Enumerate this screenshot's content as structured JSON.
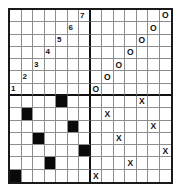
{
  "puzzle": {
    "title": "Grid Puzzle",
    "columns": 14,
    "rows": 14,
    "quadrant_size": 7,
    "colors": {
      "background": "#ffffff",
      "outer_border": "#1a1a1a",
      "thin_gridline": "#8d8d8d",
      "thick_gridline": "#111111",
      "filled_cell": "#0a0a0a",
      "glyph": "#111111"
    },
    "legend": {
      "number_note": "digits 1-7 on anti-diagonal of top-left quadrant",
      "o_note": "letter O on anti-diagonal of top-right quadrant",
      "x_note": "letter X scattered in bottom-right quadrant",
      "black_note": "filled black squares scattered in bottom-left quadrant"
    },
    "cells": [
      [
        {
          "type": "empty",
          "value": ""
        },
        {
          "type": "empty",
          "value": ""
        },
        {
          "type": "empty",
          "value": ""
        },
        {
          "type": "empty",
          "value": ""
        },
        {
          "type": "empty",
          "value": ""
        },
        {
          "type": "empty",
          "value": ""
        },
        {
          "type": "number",
          "value": "7"
        },
        {
          "type": "empty",
          "value": ""
        },
        {
          "type": "empty",
          "value": ""
        },
        {
          "type": "empty",
          "value": ""
        },
        {
          "type": "empty",
          "value": ""
        },
        {
          "type": "empty",
          "value": ""
        },
        {
          "type": "empty",
          "value": ""
        },
        {
          "type": "letter-o",
          "value": "O"
        }
      ],
      [
        {
          "type": "empty",
          "value": ""
        },
        {
          "type": "empty",
          "value": ""
        },
        {
          "type": "empty",
          "value": ""
        },
        {
          "type": "empty",
          "value": ""
        },
        {
          "type": "empty",
          "value": ""
        },
        {
          "type": "number",
          "value": "6"
        },
        {
          "type": "empty",
          "value": ""
        },
        {
          "type": "empty",
          "value": ""
        },
        {
          "type": "empty",
          "value": ""
        },
        {
          "type": "empty",
          "value": ""
        },
        {
          "type": "empty",
          "value": ""
        },
        {
          "type": "empty",
          "value": ""
        },
        {
          "type": "letter-o",
          "value": "O"
        },
        {
          "type": "empty",
          "value": ""
        }
      ],
      [
        {
          "type": "empty",
          "value": ""
        },
        {
          "type": "empty",
          "value": ""
        },
        {
          "type": "empty",
          "value": ""
        },
        {
          "type": "empty",
          "value": ""
        },
        {
          "type": "number",
          "value": "5"
        },
        {
          "type": "empty",
          "value": ""
        },
        {
          "type": "empty",
          "value": ""
        },
        {
          "type": "empty",
          "value": ""
        },
        {
          "type": "empty",
          "value": ""
        },
        {
          "type": "empty",
          "value": ""
        },
        {
          "type": "empty",
          "value": ""
        },
        {
          "type": "letter-o",
          "value": "O"
        },
        {
          "type": "empty",
          "value": ""
        },
        {
          "type": "empty",
          "value": ""
        }
      ],
      [
        {
          "type": "empty",
          "value": ""
        },
        {
          "type": "empty",
          "value": ""
        },
        {
          "type": "empty",
          "value": ""
        },
        {
          "type": "number",
          "value": "4"
        },
        {
          "type": "empty",
          "value": ""
        },
        {
          "type": "empty",
          "value": ""
        },
        {
          "type": "empty",
          "value": ""
        },
        {
          "type": "empty",
          "value": ""
        },
        {
          "type": "empty",
          "value": ""
        },
        {
          "type": "empty",
          "value": ""
        },
        {
          "type": "letter-o",
          "value": "O"
        },
        {
          "type": "empty",
          "value": ""
        },
        {
          "type": "empty",
          "value": ""
        },
        {
          "type": "empty",
          "value": ""
        }
      ],
      [
        {
          "type": "empty",
          "value": ""
        },
        {
          "type": "empty",
          "value": ""
        },
        {
          "type": "number",
          "value": "3"
        },
        {
          "type": "empty",
          "value": ""
        },
        {
          "type": "empty",
          "value": ""
        },
        {
          "type": "empty",
          "value": ""
        },
        {
          "type": "empty",
          "value": ""
        },
        {
          "type": "empty",
          "value": ""
        },
        {
          "type": "empty",
          "value": ""
        },
        {
          "type": "letter-o",
          "value": "O"
        },
        {
          "type": "empty",
          "value": ""
        },
        {
          "type": "empty",
          "value": ""
        },
        {
          "type": "empty",
          "value": ""
        },
        {
          "type": "empty",
          "value": ""
        }
      ],
      [
        {
          "type": "empty",
          "value": ""
        },
        {
          "type": "number",
          "value": "2"
        },
        {
          "type": "empty",
          "value": ""
        },
        {
          "type": "empty",
          "value": ""
        },
        {
          "type": "empty",
          "value": ""
        },
        {
          "type": "empty",
          "value": ""
        },
        {
          "type": "empty",
          "value": ""
        },
        {
          "type": "empty",
          "value": ""
        },
        {
          "type": "letter-o",
          "value": "O"
        },
        {
          "type": "empty",
          "value": ""
        },
        {
          "type": "empty",
          "value": ""
        },
        {
          "type": "empty",
          "value": ""
        },
        {
          "type": "empty",
          "value": ""
        },
        {
          "type": "empty",
          "value": ""
        }
      ],
      [
        {
          "type": "number",
          "value": "1"
        },
        {
          "type": "empty",
          "value": ""
        },
        {
          "type": "empty",
          "value": ""
        },
        {
          "type": "empty",
          "value": ""
        },
        {
          "type": "empty",
          "value": ""
        },
        {
          "type": "empty",
          "value": ""
        },
        {
          "type": "empty",
          "value": ""
        },
        {
          "type": "letter-o",
          "value": "O"
        },
        {
          "type": "empty",
          "value": ""
        },
        {
          "type": "empty",
          "value": ""
        },
        {
          "type": "empty",
          "value": ""
        },
        {
          "type": "empty",
          "value": ""
        },
        {
          "type": "empty",
          "value": ""
        },
        {
          "type": "empty",
          "value": ""
        }
      ],
      [
        {
          "type": "empty",
          "value": ""
        },
        {
          "type": "empty",
          "value": ""
        },
        {
          "type": "empty",
          "value": ""
        },
        {
          "type": "empty",
          "value": ""
        },
        {
          "type": "filled",
          "value": ""
        },
        {
          "type": "empty",
          "value": ""
        },
        {
          "type": "empty",
          "value": ""
        },
        {
          "type": "empty",
          "value": ""
        },
        {
          "type": "empty",
          "value": ""
        },
        {
          "type": "empty",
          "value": ""
        },
        {
          "type": "empty",
          "value": ""
        },
        {
          "type": "letter-x",
          "value": "X"
        },
        {
          "type": "empty",
          "value": ""
        },
        {
          "type": "empty",
          "value": ""
        }
      ],
      [
        {
          "type": "empty",
          "value": ""
        },
        {
          "type": "filled",
          "value": ""
        },
        {
          "type": "empty",
          "value": ""
        },
        {
          "type": "empty",
          "value": ""
        },
        {
          "type": "empty",
          "value": ""
        },
        {
          "type": "empty",
          "value": ""
        },
        {
          "type": "empty",
          "value": ""
        },
        {
          "type": "empty",
          "value": ""
        },
        {
          "type": "letter-x",
          "value": "X"
        },
        {
          "type": "empty",
          "value": ""
        },
        {
          "type": "empty",
          "value": ""
        },
        {
          "type": "empty",
          "value": ""
        },
        {
          "type": "empty",
          "value": ""
        },
        {
          "type": "empty",
          "value": ""
        }
      ],
      [
        {
          "type": "empty",
          "value": ""
        },
        {
          "type": "empty",
          "value": ""
        },
        {
          "type": "empty",
          "value": ""
        },
        {
          "type": "empty",
          "value": ""
        },
        {
          "type": "empty",
          "value": ""
        },
        {
          "type": "filled",
          "value": ""
        },
        {
          "type": "empty",
          "value": ""
        },
        {
          "type": "empty",
          "value": ""
        },
        {
          "type": "empty",
          "value": ""
        },
        {
          "type": "empty",
          "value": ""
        },
        {
          "type": "empty",
          "value": ""
        },
        {
          "type": "empty",
          "value": ""
        },
        {
          "type": "letter-x",
          "value": "X"
        },
        {
          "type": "empty",
          "value": ""
        }
      ],
      [
        {
          "type": "empty",
          "value": ""
        },
        {
          "type": "empty",
          "value": ""
        },
        {
          "type": "filled",
          "value": ""
        },
        {
          "type": "empty",
          "value": ""
        },
        {
          "type": "empty",
          "value": ""
        },
        {
          "type": "empty",
          "value": ""
        },
        {
          "type": "empty",
          "value": ""
        },
        {
          "type": "empty",
          "value": ""
        },
        {
          "type": "empty",
          "value": ""
        },
        {
          "type": "letter-x",
          "value": "X"
        },
        {
          "type": "empty",
          "value": ""
        },
        {
          "type": "empty",
          "value": ""
        },
        {
          "type": "empty",
          "value": ""
        },
        {
          "type": "empty",
          "value": ""
        }
      ],
      [
        {
          "type": "empty",
          "value": ""
        },
        {
          "type": "empty",
          "value": ""
        },
        {
          "type": "empty",
          "value": ""
        },
        {
          "type": "empty",
          "value": ""
        },
        {
          "type": "empty",
          "value": ""
        },
        {
          "type": "empty",
          "value": ""
        },
        {
          "type": "filled",
          "value": ""
        },
        {
          "type": "empty",
          "value": ""
        },
        {
          "type": "empty",
          "value": ""
        },
        {
          "type": "empty",
          "value": ""
        },
        {
          "type": "empty",
          "value": ""
        },
        {
          "type": "empty",
          "value": ""
        },
        {
          "type": "empty",
          "value": ""
        },
        {
          "type": "letter-x",
          "value": "X"
        }
      ],
      [
        {
          "type": "empty",
          "value": ""
        },
        {
          "type": "empty",
          "value": ""
        },
        {
          "type": "empty",
          "value": ""
        },
        {
          "type": "filled",
          "value": ""
        },
        {
          "type": "empty",
          "value": ""
        },
        {
          "type": "empty",
          "value": ""
        },
        {
          "type": "empty",
          "value": ""
        },
        {
          "type": "empty",
          "value": ""
        },
        {
          "type": "empty",
          "value": ""
        },
        {
          "type": "empty",
          "value": ""
        },
        {
          "type": "letter-x",
          "value": "X"
        },
        {
          "type": "empty",
          "value": ""
        },
        {
          "type": "empty",
          "value": ""
        },
        {
          "type": "empty",
          "value": ""
        }
      ],
      [
        {
          "type": "filled",
          "value": ""
        },
        {
          "type": "empty",
          "value": ""
        },
        {
          "type": "empty",
          "value": ""
        },
        {
          "type": "empty",
          "value": ""
        },
        {
          "type": "empty",
          "value": ""
        },
        {
          "type": "empty",
          "value": ""
        },
        {
          "type": "empty",
          "value": ""
        },
        {
          "type": "letter-x",
          "value": "X"
        },
        {
          "type": "empty",
          "value": ""
        },
        {
          "type": "empty",
          "value": ""
        },
        {
          "type": "empty",
          "value": ""
        },
        {
          "type": "empty",
          "value": ""
        },
        {
          "type": "empty",
          "value": ""
        },
        {
          "type": "empty",
          "value": ""
        }
      ]
    ]
  }
}
